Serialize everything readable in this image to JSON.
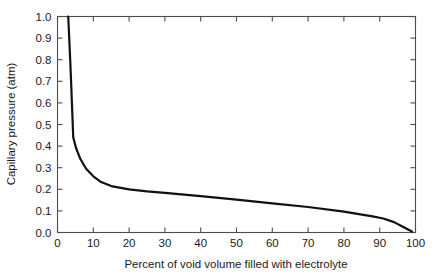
{
  "chart_data": {
    "type": "line",
    "title": "",
    "xlabel": "Percent of void volume filled with electrolyte",
    "ylabel": "Capillary pressure (atm)",
    "xlim": [
      0,
      100
    ],
    "ylim": [
      0.0,
      1.0
    ],
    "grid": false,
    "legend": "none",
    "x_ticks": [
      0,
      10,
      20,
      30,
      40,
      50,
      60,
      70,
      80,
      90,
      100
    ],
    "x_tick_labels": [
      "0",
      "10",
      "20",
      "30",
      "40",
      "50",
      "60",
      "70",
      "80",
      "90",
      "100"
    ],
    "y_ticks": [
      0.0,
      0.1,
      0.2,
      0.3,
      0.4,
      0.5,
      0.6,
      0.7,
      0.8,
      0.9,
      1.0
    ],
    "y_tick_labels": [
      "0.0",
      "0.1",
      "0.2",
      "0.3",
      "0.4",
      "0.5",
      "0.6",
      "0.7",
      "0.8",
      "0.9",
      "1.0"
    ],
    "series": [
      {
        "name": "Capillary pressure curve",
        "color": "#111111",
        "x": [
          3.0,
          3.6,
          4.4,
          5.2,
          6.4,
          8.0,
          10.0,
          12.0,
          15.0,
          20.0,
          25.0,
          30.0,
          40.0,
          50.0,
          60.0,
          70.0,
          80.0,
          88.0,
          91.0,
          94.0,
          97.0,
          99.0
        ],
        "y": [
          1.0,
          0.78,
          0.44,
          0.39,
          0.34,
          0.295,
          0.26,
          0.235,
          0.215,
          0.2,
          0.19,
          0.183,
          0.168,
          0.152,
          0.135,
          0.118,
          0.097,
          0.075,
          0.065,
          0.048,
          0.022,
          0.005
        ]
      }
    ]
  },
  "axes": {
    "x_axis_name": "x-axis",
    "y_axis_name": "y-axis"
  }
}
